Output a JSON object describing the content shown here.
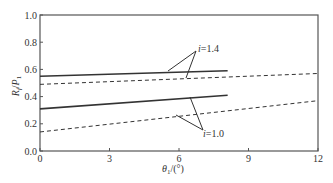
{
  "chart_data": {
    "type": "line",
    "title": "",
    "xlabel": "θ1/(°)",
    "ylabel": "Rf/P1",
    "xlim": [
      0,
      12
    ],
    "ylim": [
      0,
      1.0
    ],
    "xticks": [
      "0",
      "3",
      "6",
      "9",
      "12"
    ],
    "yticks": [
      "0.0",
      "0.2",
      "0.4",
      "0.6",
      "0.8",
      "1.0"
    ],
    "grid": false,
    "legend": "none (inline annotations)",
    "annotations": [
      {
        "text": "i=1.4",
        "targets": [
          "i=1.4 solid",
          "i=1.4 dashed"
        ]
      },
      {
        "text": "i=1.0",
        "targets": [
          "i=1.0 solid",
          "i=1.0 dashed"
        ]
      }
    ],
    "series": [
      {
        "name": "i=1.4 solid",
        "style": "solid",
        "x": [
          0,
          8.1
        ],
        "y": [
          0.55,
          0.59
        ]
      },
      {
        "name": "i=1.4 dashed",
        "style": "dashed",
        "x": [
          0,
          12
        ],
        "y": [
          0.49,
          0.57
        ]
      },
      {
        "name": "i=1.0 solid",
        "style": "solid",
        "x": [
          0,
          8.1
        ],
        "y": [
          0.31,
          0.41
        ]
      },
      {
        "name": "i=1.0 dashed",
        "style": "dashed",
        "x": [
          0,
          12
        ],
        "y": [
          0.14,
          0.37
        ]
      }
    ]
  },
  "labels": {
    "xlabel_theta": "θ",
    "xlabel_sub": "1",
    "xlabel_unit": "/(°)",
    "ylabel_R": "R",
    "ylabel_f": "f",
    "ylabel_slash": "/",
    "ylabel_P": "P",
    "ylabel_1": "1",
    "annot_top": "i=1.4",
    "annot_bottom": "i=1.0"
  }
}
